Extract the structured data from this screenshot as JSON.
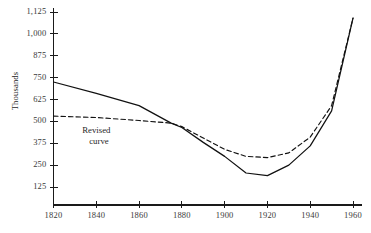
{
  "chart_data": {
    "type": "line",
    "title": "",
    "xlabel": "",
    "ylabel": "Thousands",
    "xlim": [
      1820,
      1960
    ],
    "ylim": [
      0,
      1175
    ],
    "grid": false,
    "legend_position": "inline-annotation",
    "xticks": [
      "1820",
      "1840",
      "1860",
      "1880",
      "1900",
      "1920",
      "1940",
      "1960"
    ],
    "xtick_values": [
      1820,
      1840,
      1860,
      1880,
      1900,
      1920,
      1940,
      1960
    ],
    "yticks": [
      "125",
      "250",
      "375",
      "500",
      "625",
      "750",
      "875",
      "1,000",
      "1,125"
    ],
    "ytick_values": [
      125,
      250,
      375,
      500,
      625,
      750,
      875,
      1000,
      1125
    ],
    "annotations": [
      {
        "text_line1": "Revised",
        "text_line2": "curve",
        "x": 1832,
        "y": 445
      }
    ],
    "series": [
      {
        "name": "Original curve",
        "style": "solid",
        "color": "#111111",
        "x": [
          1820,
          1840,
          1860,
          1875,
          1880,
          1890,
          1900,
          1910,
          1920,
          1930,
          1940,
          1950,
          1960
        ],
        "values": [
          725,
          660,
          590,
          490,
          465,
          380,
          300,
          205,
          190,
          250,
          360,
          560,
          1090
        ]
      },
      {
        "name": "Revised curve",
        "style": "dashed",
        "color": "#111111",
        "x": [
          1820,
          1840,
          1860,
          1875,
          1880,
          1890,
          1900,
          1910,
          1920,
          1930,
          1940,
          1950,
          1960
        ],
        "values": [
          530,
          522,
          505,
          490,
          470,
          405,
          340,
          300,
          293,
          320,
          410,
          590,
          1090
        ]
      }
    ]
  }
}
